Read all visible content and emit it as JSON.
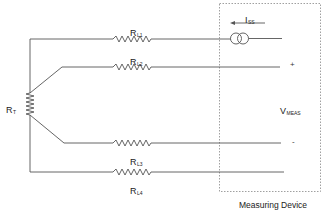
{
  "diagram": {
    "sensor": {
      "label": "R",
      "subscript": "T"
    },
    "lead_resistors": [
      {
        "label": "R",
        "subscript": "L1"
      },
      {
        "label": "R",
        "subscript": "L2"
      },
      {
        "label": "R",
        "subscript": "L3"
      },
      {
        "label": "R",
        "subscript": "L4"
      }
    ],
    "current_source": {
      "label": "I",
      "subscript": "SS",
      "direction": "left"
    },
    "voltage": {
      "label": "V",
      "subscript": "MEAS",
      "plus": "+",
      "minus": "-"
    },
    "device_box": {
      "caption": "Measuring Device",
      "style": "dashed"
    },
    "colors": {
      "wire": "#555555",
      "text": "#222222",
      "box": "#888888"
    }
  }
}
